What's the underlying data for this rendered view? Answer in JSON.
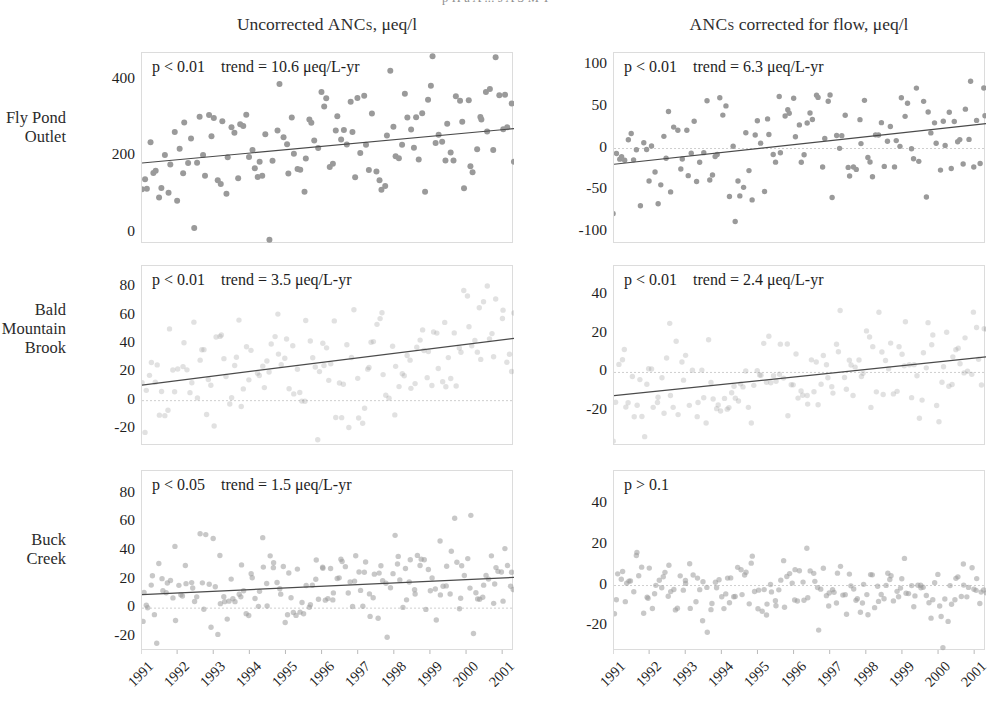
{
  "figure": {
    "caption_clipped": "p     H   a   A  ...   s   A   S   M   T",
    "columns": [
      {
        "id": "uncorrected",
        "label_pre": "Uncorrected ",
        "label_sc": "ANCs",
        "label_post": ", μeq/l"
      },
      {
        "id": "flow_corrected",
        "label_pre": "",
        "label_sc": "ANCs",
        "label_post": " corrected for flow, μeq/l"
      }
    ],
    "rows": [
      {
        "id": "fly-pond-outlet",
        "label_lines": [
          "Fly Pond",
          "Outlet"
        ]
      },
      {
        "id": "bald-mountain-brook",
        "label_lines": [
          "Bald",
          "Mountain",
          "Brook"
        ]
      },
      {
        "id": "buck-creek",
        "label_lines": [
          "Buck",
          "Creek"
        ]
      }
    ],
    "xaxis": {
      "ticks": [
        "1991",
        "1992",
        "1993",
        "1994",
        "1995",
        "1996",
        "1997",
        "1998",
        "1999",
        "2000",
        "2001"
      ],
      "min": 1991.0,
      "max": 2001.3
    },
    "marker_color": "#9a9a9a",
    "marker_color_faint": "#d2d2d2",
    "trend_color": "#4a4a4a",
    "zeroline_color": "#cfcfcf",
    "frame_color": "#dcdcdc"
  },
  "chart_data": [
    {
      "id": "fly-pond-outlet-uncorrected",
      "type": "scatter",
      "row": "Fly Pond Outlet",
      "column": "Uncorrected ANCs, μeq/l",
      "p_text": "p < 0.01",
      "trend_text": "trend = 10.6 μeq/L-yr",
      "trend_value": 10.6,
      "p_value": "<0.01",
      "ylabel": "Uncorrected ANC, μeq/l",
      "xlabel": "",
      "yticks": [
        0,
        200,
        400
      ],
      "ylim": [
        -30,
        470
      ],
      "xlim": [
        1991.0,
        2001.3
      ],
      "grid": false,
      "zero_line": false,
      "trendline": {
        "x0": 1991.0,
        "y0": 182,
        "x1": 2001.3,
        "y1": 272
      },
      "marker_opacity": 1.0,
      "n_points": 130,
      "scatter_mean": 225,
      "scatter_sd": 78,
      "points_seed": 11
    },
    {
      "id": "fly-pond-outlet-flowcorrected",
      "type": "scatter",
      "row": "Fly Pond Outlet",
      "column": "ANCs corrected for flow, μeq/l",
      "p_text": "p < 0.01",
      "trend_text": "trend = 6.3 μeq/L-yr",
      "trend_value": 6.3,
      "p_value": "<0.01",
      "ylabel": "Flow-corrected ANC, μeq/l",
      "xlabel": "",
      "yticks": [
        -100,
        -50,
        0,
        50,
        100
      ],
      "ylim": [
        -115,
        115
      ],
      "xlim": [
        1991.0,
        2001.3
      ],
      "grid": false,
      "zero_line": true,
      "trendline": {
        "x0": 1991.0,
        "y0": -19,
        "x1": 2001.3,
        "y1": 30
      },
      "marker_opacity": 1.0,
      "n_points": 130,
      "scatter_mean": 0,
      "scatter_sd": 38,
      "points_seed": 23
    },
    {
      "id": "bald-mountain-brook-uncorrected",
      "type": "scatter",
      "row": "Bald Mountain Brook",
      "column": "Uncorrected ANCs, μeq/l",
      "p_text": "p < 0.01",
      "trend_text": "trend = 3.5 μeq/L-yr",
      "trend_value": 3.5,
      "p_value": "<0.01",
      "ylabel": "Uncorrected ANC, μeq/l",
      "xlabel": "",
      "yticks": [
        -20,
        0,
        20,
        40,
        60,
        80
      ],
      "ylim": [
        -32,
        95
      ],
      "xlim": [
        1991.0,
        2001.3
      ],
      "grid": false,
      "zero_line": true,
      "trendline": {
        "x0": 1991.0,
        "y0": 11,
        "x1": 2001.3,
        "y1": 44
      },
      "marker_opacity": 0.3,
      "n_points": 150,
      "scatter_mean": 22,
      "scatter_sd": 22,
      "points_seed": 37
    },
    {
      "id": "bald-mountain-brook-flowcorrected",
      "type": "scatter",
      "row": "Bald Mountain Brook",
      "column": "ANCs corrected for flow, μeq/l",
      "p_text": "p < 0.01",
      "trend_text": "trend = 2.4 μeq/L-yr",
      "trend_value": 2.4,
      "p_value": "<0.01",
      "ylabel": "Flow-corrected ANC, μeq/l",
      "xlabel": "",
      "yticks": [
        -20,
        0,
        20,
        40
      ],
      "ylim": [
        -38,
        55
      ],
      "xlim": [
        1991.0,
        2001.3
      ],
      "grid": false,
      "zero_line": true,
      "trendline": {
        "x0": 1991.0,
        "y0": -12,
        "x1": 2001.3,
        "y1": 8
      },
      "marker_opacity": 0.3,
      "n_points": 150,
      "scatter_mean": -2,
      "scatter_sd": 12,
      "points_seed": 51
    },
    {
      "id": "buck-creek-uncorrected",
      "type": "scatter",
      "row": "Buck Creek",
      "column": "Uncorrected ANCs, μeq/l",
      "p_text": "p < 0.05",
      "trend_text": "trend = 1.5 μeq/L-yr",
      "trend_value": 1.5,
      "p_value": "<0.05",
      "ylabel": "Uncorrected ANC, μeq/l",
      "xlabel": "",
      "yticks": [
        -20,
        0,
        20,
        40,
        60,
        80
      ],
      "ylim": [
        -30,
        96
      ],
      "xlim": [
        1991.0,
        2001.3
      ],
      "grid": false,
      "zero_line": true,
      "trendline": {
        "x0": 1991.0,
        "y0": 9.5,
        "x1": 2001.3,
        "y1": 21.5
      },
      "marker_opacity": 0.55,
      "n_points": 175,
      "scatter_mean": 11,
      "scatter_sd": 16,
      "points_seed": 67
    },
    {
      "id": "buck-creek-flowcorrected",
      "type": "scatter",
      "row": "Buck Creek",
      "column": "ANCs corrected for flow, μeq/l",
      "p_text": "p > 0.1",
      "trend_text": "",
      "trend_value": null,
      "p_value": ">0.1",
      "ylabel": "Flow-corrected ANC, μeq/l",
      "xlabel": "",
      "yticks": [
        -20,
        0,
        20,
        40
      ],
      "ylim": [
        -32,
        56
      ],
      "xlim": [
        1991.0,
        2001.3
      ],
      "grid": false,
      "zero_line": true,
      "trendline": null,
      "marker_opacity": 0.55,
      "n_points": 175,
      "scatter_mean": -2,
      "scatter_sd": 8,
      "points_seed": 83
    }
  ]
}
